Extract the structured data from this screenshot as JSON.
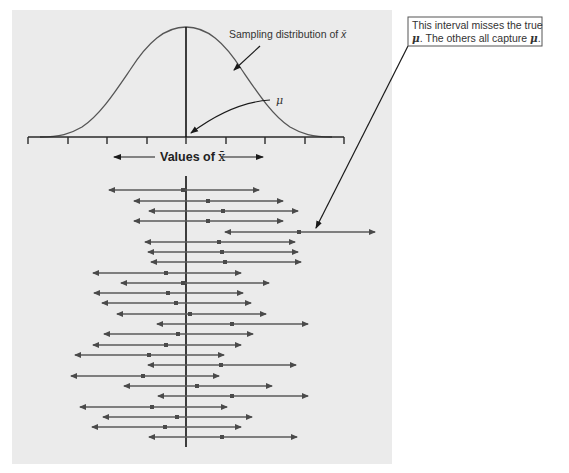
{
  "figure": {
    "curve_label": "Sampling distribution of ",
    "curve_label_var": "x̄",
    "mu_label": "μ",
    "axis_label_prefix": "Values of ",
    "axis_label_var": "x̄",
    "callout": {
      "line1": "This interval misses the true",
      "line2_mu1": "μ",
      "line2_mid": ". The others all capture ",
      "line2_mu2": "μ",
      "line2_end": "."
    },
    "colors": {
      "panel": "#ebebeb",
      "interval": "#5a5a5a",
      "mean_line": "#111111"
    }
  },
  "chart_data": {
    "type": "interval-plot",
    "title": "",
    "mu_x": 186,
    "axis_ticks_x": [
      28,
      68,
      107,
      147,
      186,
      226,
      265,
      305,
      344
    ],
    "intervals": [
      {
        "left": 109,
        "center": 183,
        "right": 259,
        "y": 190,
        "captures_mu": true
      },
      {
        "left": 134,
        "center": 208,
        "right": 283,
        "y": 201,
        "captures_mu": true
      },
      {
        "left": 149,
        "center": 223,
        "right": 298,
        "y": 211,
        "captures_mu": true
      },
      {
        "left": 134,
        "center": 208,
        "right": 283,
        "y": 221,
        "captures_mu": true
      },
      {
        "left": 225,
        "center": 299,
        "right": 375,
        "y": 232,
        "captures_mu": false
      },
      {
        "left": 145,
        "center": 219,
        "right": 295,
        "y": 242,
        "captures_mu": true
      },
      {
        "left": 148,
        "center": 222,
        "right": 298,
        "y": 252,
        "captures_mu": true
      },
      {
        "left": 151,
        "center": 225,
        "right": 301,
        "y": 262,
        "captures_mu": true
      },
      {
        "left": 93,
        "center": 166,
        "right": 241,
        "y": 273,
        "captures_mu": true
      },
      {
        "left": 121,
        "center": 183,
        "right": 269,
        "y": 283,
        "captures_mu": true
      },
      {
        "left": 94,
        "center": 168,
        "right": 243,
        "y": 293,
        "captures_mu": true
      },
      {
        "left": 102,
        "center": 176,
        "right": 251,
        "y": 303,
        "captures_mu": true
      },
      {
        "left": 117,
        "center": 190,
        "right": 266,
        "y": 314,
        "captures_mu": true
      },
      {
        "left": 157,
        "center": 232,
        "right": 308,
        "y": 324,
        "captures_mu": true
      },
      {
        "left": 104,
        "center": 178,
        "right": 253,
        "y": 334,
        "captures_mu": true
      },
      {
        "left": 93,
        "center": 166,
        "right": 241,
        "y": 345,
        "captures_mu": true
      },
      {
        "left": 75,
        "center": 149,
        "right": 224,
        "y": 355,
        "captures_mu": true
      },
      {
        "left": 148,
        "center": 221,
        "right": 296,
        "y": 365,
        "captures_mu": true
      },
      {
        "left": 71,
        "center": 143,
        "right": 219,
        "y": 376,
        "captures_mu": true
      },
      {
        "left": 124,
        "center": 197,
        "right": 272,
        "y": 386,
        "captures_mu": true
      },
      {
        "left": 158,
        "center": 232,
        "right": 308,
        "y": 396,
        "captures_mu": true
      },
      {
        "left": 80,
        "center": 152,
        "right": 227,
        "y": 407,
        "captures_mu": true
      },
      {
        "left": 103,
        "center": 177,
        "right": 252,
        "y": 417,
        "captures_mu": true
      },
      {
        "left": 92,
        "center": 165,
        "right": 241,
        "y": 427,
        "captures_mu": true
      },
      {
        "left": 149,
        "center": 222,
        "right": 297,
        "y": 437,
        "captures_mu": true
      }
    ]
  }
}
